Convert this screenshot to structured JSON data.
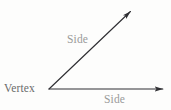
{
  "figure": {
    "type": "geometry-diagram",
    "background_color": "#fdfdfc",
    "stroke_color": "#2f2f33",
    "width": 171,
    "height": 110
  },
  "labels": {
    "vertex": "Vertex",
    "side_upper": "Side",
    "side_lower": "Side"
  },
  "geometry": {
    "vertex_point": {
      "x": 49,
      "y": 89
    },
    "ray_upper": {
      "name": "upper-ray",
      "from": {
        "x": 49,
        "y": 89
      },
      "to": {
        "x": 132,
        "y": 10
      },
      "has_arrowhead": true
    },
    "ray_lower": {
      "name": "lower-ray",
      "from": {
        "x": 49,
        "y": 89
      },
      "to": {
        "x": 165,
        "y": 89
      },
      "has_arrowhead": true
    }
  }
}
